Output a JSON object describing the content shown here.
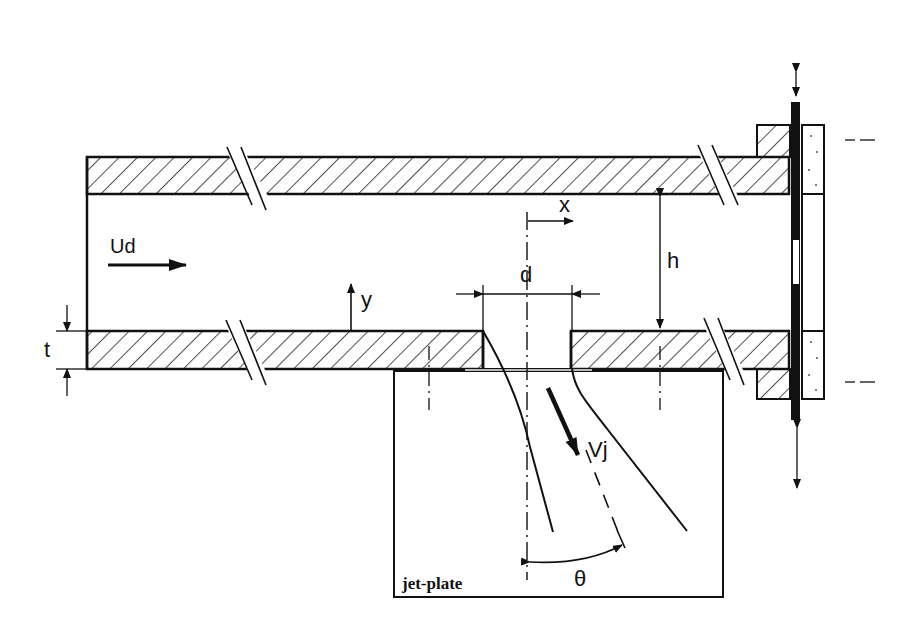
{
  "diagram": {
    "colors": {
      "stroke": "#111111",
      "background": "#ffffff",
      "hatch": "#222222"
    },
    "labels": {
      "inflow_velocity": "Ud",
      "channel_height": "h",
      "wall_thickness": "t",
      "hole_diameter": "d",
      "x_axis": "x",
      "y_axis": "y",
      "jet_velocity": "Vj",
      "jet_angle": "θ",
      "jet_plate": "jet-plate"
    },
    "components": [
      "upper-wall",
      "lower-wall",
      "jet-hole",
      "jet-plate",
      "end-flange",
      "sliding-plate"
    ]
  }
}
